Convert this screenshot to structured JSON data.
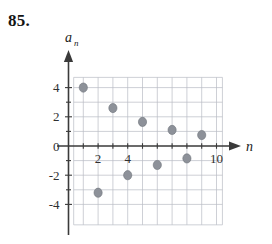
{
  "problem": {
    "number": "85."
  },
  "chart_data": {
    "type": "scatter",
    "title": "",
    "xlabel": "n",
    "ylabel": "a_n",
    "ylabel_base": "a",
    "ylabel_sub": "n",
    "xlim": [
      0,
      10.3
    ],
    "ylim": [
      -5,
      5
    ],
    "grid": true,
    "legend_position": "none",
    "point_color": "#8d9199",
    "axis_color": "#3a3a3a",
    "grid_color": "#b9bcc4",
    "x_ticks": [
      2,
      4,
      10
    ],
    "x_tick_labels": [
      "2",
      "4",
      "10"
    ],
    "y_ticks": [
      4,
      2,
      0,
      -2,
      -4
    ],
    "y_tick_labels": [
      "4",
      "2",
      "0",
      "-2",
      "-4"
    ],
    "x_grid_values": [
      1,
      2,
      3,
      4,
      5,
      6,
      7,
      8,
      9,
      10
    ],
    "y_grid_values": [
      -4,
      -3,
      -2,
      -1,
      1,
      2,
      3,
      4
    ],
    "x": [
      1,
      2,
      3,
      4,
      5,
      6,
      7,
      8,
      9
    ],
    "y": [
      4,
      -3.2,
      2.6,
      -2,
      1.65,
      -1.3,
      1.1,
      -0.85,
      0.75
    ],
    "points": [
      {
        "n": 1,
        "a": 4
      },
      {
        "n": 2,
        "a": -3.2
      },
      {
        "n": 3,
        "a": 2.6
      },
      {
        "n": 4,
        "a": -2
      },
      {
        "n": 5,
        "a": 1.65
      },
      {
        "n": 6,
        "a": -1.3
      },
      {
        "n": 7,
        "a": 1.1
      },
      {
        "n": 8,
        "a": -0.85
      },
      {
        "n": 9,
        "a": 0.75
      }
    ]
  }
}
